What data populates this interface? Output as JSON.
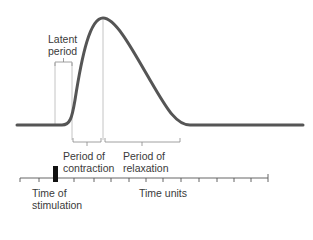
{
  "diagram": {
    "type": "muscle-twitch-myogram",
    "labels": {
      "latent_line1": "Latent",
      "latent_line2": "period",
      "contraction_line1": "Period of",
      "contraction_line2": "contraction",
      "relaxation_line1": "Period of",
      "relaxation_line2": "relaxation",
      "stimulation_line1": "Time of",
      "stimulation_line2": "stimulation",
      "axis": "Time units"
    },
    "colors": {
      "curve": "#555555",
      "guides": "#b0b0b0",
      "axis": "#555555",
      "stimulus_marker": "#111111"
    }
  }
}
